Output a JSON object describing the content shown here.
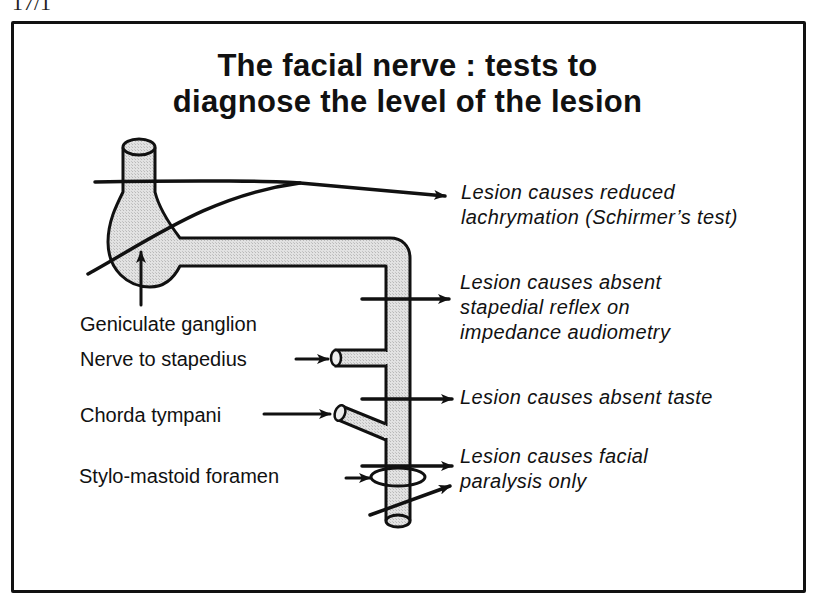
{
  "page": {
    "corner_label": "17/1"
  },
  "title": {
    "line1": "The facial nerve : tests to",
    "line2": "diagnose the level of the lesion"
  },
  "anatomy_labels": [
    {
      "id": "geniculate",
      "text": "Geniculate ganglion"
    },
    {
      "id": "stapedius",
      "text": "Nerve to stapedius"
    },
    {
      "id": "chorda",
      "text": "Chorda tympani"
    },
    {
      "id": "stylomastoid",
      "text": "Stylo-mastoid foramen"
    }
  ],
  "lesion_results": [
    {
      "level": "above geniculate ganglion",
      "line1": "Lesion causes reduced",
      "line2": "lachrymation (Schirmer’s test)"
    },
    {
      "level": "above nerve to stapedius",
      "line1": "Lesion causes absent",
      "line2": "stapedial reflex on",
      "line3": "impedance audiometry"
    },
    {
      "level": "above chorda tympani",
      "line1": "Lesion causes absent taste"
    },
    {
      "level": "at stylo-mastoid foramen",
      "line1": "Lesion causes facial",
      "line2": "paralysis only"
    }
  ],
  "colors": {
    "ink": "#111111",
    "nerve_fill": "#dcdcdc",
    "background": "#ffffff"
  }
}
